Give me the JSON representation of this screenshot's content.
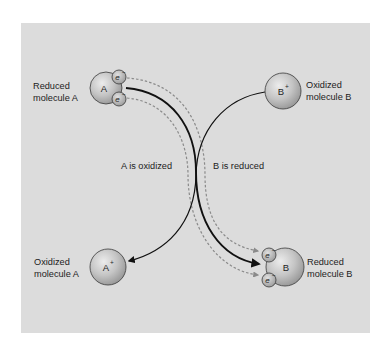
{
  "diagram": {
    "colors": {
      "panel_background": "#dcdcdc",
      "molecule_light": "#e2e2e2",
      "molecule_dark": "#9c9c9c",
      "outline": "#3a3a3a",
      "solid_arrow": "#111111",
      "dashed_arrow": "#8a8a8a"
    },
    "nodes": {
      "reduced_a": {
        "label_line1": "Reduced",
        "label_line2": "molecule A",
        "symbol": "A",
        "electrons": [
          "e",
          "e"
        ],
        "electron_sup": "−"
      },
      "oxidized_b": {
        "label_line1": "Oxidized",
        "label_line2": "molecule B",
        "symbol": "B",
        "sup": "+"
      },
      "oxidized_a": {
        "label_line1": "Oxidized",
        "label_line2": "molecule A",
        "symbol": "A",
        "sup": "+"
      },
      "reduced_b": {
        "label_line1": "Reduced",
        "label_line2": "molecule B",
        "symbol": "B",
        "electrons": [
          "e",
          "e"
        ],
        "electron_sup": "−"
      }
    },
    "process_labels": {
      "left": "A is oxidized",
      "right": "B is reduced"
    },
    "edges": [
      {
        "from": "reduced_a",
        "to": "reduced_b",
        "style": "solid-thick"
      },
      {
        "from": "oxidized_b",
        "to": "oxidized_a",
        "style": "solid"
      },
      {
        "from": "reduced_a.electron_1",
        "to": "reduced_b.electron_1",
        "style": "dashed"
      },
      {
        "from": "reduced_a.electron_2",
        "to": "reduced_b.electron_2",
        "style": "dashed"
      }
    ]
  }
}
